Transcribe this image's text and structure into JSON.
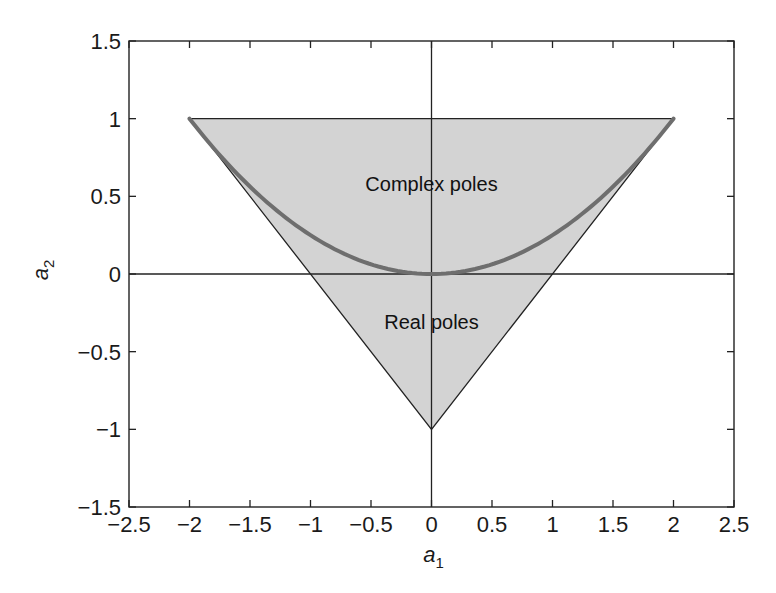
{
  "chart_data": {
    "type": "area",
    "title": "",
    "xlabel": "a1",
    "ylabel": "a2",
    "xlabel_main": "a",
    "xlabel_sub": "1",
    "ylabel_main": "a",
    "ylabel_sub": "2",
    "xlim": [
      -2.5,
      2.5
    ],
    "ylim": [
      -1.5,
      1.5
    ],
    "xticks": [
      -2.5,
      -2,
      -1.5,
      -1,
      -0.5,
      0,
      0.5,
      1,
      1.5,
      2,
      2.5
    ],
    "xtick_labels": [
      "−2.5",
      "−2",
      "−1.5",
      "−1",
      "−0.5",
      "0",
      "0.5",
      "1",
      "1.5",
      "2",
      "2.5"
    ],
    "yticks": [
      -1.5,
      -1,
      -0.5,
      0,
      0.5,
      1,
      1.5
    ],
    "ytick_labels": [
      "−1.5",
      "−1",
      "−0.5",
      "0",
      "0.5",
      "1",
      "1.5"
    ],
    "grid": false,
    "reference_lines": {
      "x": 0,
      "y": 0
    },
    "series": [
      {
        "name": "Stability triangle",
        "kind": "filled_polygon",
        "points": [
          [
            -2,
            1
          ],
          [
            2,
            1
          ],
          [
            0,
            -1
          ]
        ],
        "fill": "#d3d3d3",
        "stroke": "#222222"
      },
      {
        "name": "Boundary a2 = a1^2/4",
        "kind": "curve",
        "equation": "a2 = a1^2 / 4",
        "x_range": [
          -2,
          2
        ],
        "stroke": "#6e6e6e",
        "stroke_width": 4
      }
    ],
    "annotations": [
      {
        "text": "Complex poles",
        "x": 0,
        "y": 0.58
      },
      {
        "text": "Real poles",
        "x": 0,
        "y": -0.31
      }
    ]
  },
  "labels": {
    "complex_poles": "Complex poles",
    "real_poles": "Real poles"
  }
}
